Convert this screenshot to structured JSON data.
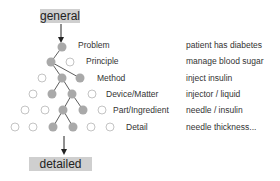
{
  "top_box": {
    "label": "general"
  },
  "bottom_box": {
    "label": "detailed"
  },
  "levels": [
    {
      "label": "Problem",
      "example": "patient has diabetes"
    },
    {
      "label": "Principle",
      "example": "manage blood sugar"
    },
    {
      "label": "Method",
      "example": "inject insulin"
    },
    {
      "label": "Device/Matter",
      "example": "injector / liquid"
    },
    {
      "label": "Part/Ingredient",
      "example": "needle / insulin"
    },
    {
      "label": "Detail",
      "example": "needle thickness..."
    }
  ],
  "colors": {
    "filled_node": "#a9a9a9",
    "open_node_stroke": "#b5b5b5",
    "box": "#cfcfcf",
    "line": "#333333"
  }
}
